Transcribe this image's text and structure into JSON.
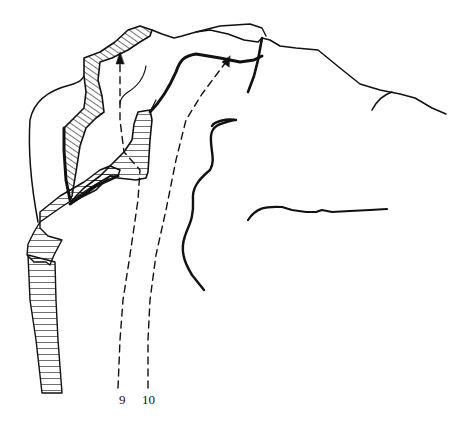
{
  "diagram": {
    "type": "climbing-topo",
    "routes": [
      {
        "number": "9",
        "label": "9"
      },
      {
        "number": "10",
        "label": "10"
      }
    ],
    "colors": {
      "ink": "#111111",
      "background": "#ffffff"
    }
  }
}
